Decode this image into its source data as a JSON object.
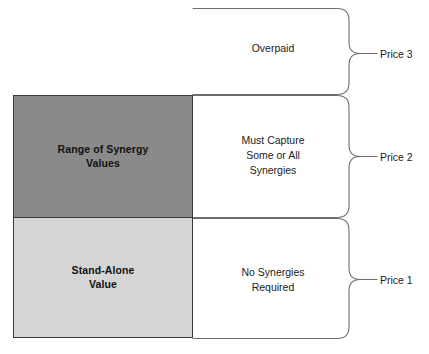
{
  "diagram": {
    "background_color": "#ffffff",
    "value_boxes": [
      {
        "id": "range-of-synergy-values",
        "label": "Range of Synergy\nValues",
        "fill_color": "#8a8a8a",
        "border_color": "#3a3a3a"
      },
      {
        "id": "stand-alone-value",
        "label": "Stand-Alone\nValue",
        "fill_color": "#d5d5d5",
        "border_color": "#3a3a3a"
      }
    ],
    "descriptions": [
      {
        "id": "overpaid",
        "text": "Overpaid"
      },
      {
        "id": "must-capture",
        "text": "Must Capture\nSome or All\nSynergies"
      },
      {
        "id": "no-synergies",
        "text": "No Synergies\nRequired"
      }
    ],
    "price_labels": [
      {
        "id": "price-3",
        "text": "Price 3"
      },
      {
        "id": "price-2",
        "text": "Price 2"
      },
      {
        "id": "price-1",
        "text": "Price 1"
      }
    ],
    "brace_color": "#6e6e6e"
  }
}
